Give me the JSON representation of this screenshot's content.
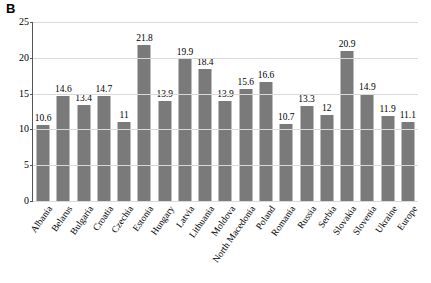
{
  "panel": {
    "label": "B"
  },
  "caption": {
    "text": ""
  },
  "chart_data": {
    "type": "bar",
    "title": "B",
    "xlabel": "",
    "ylabel": "",
    "ylim": [
      0,
      25
    ],
    "yticks": [
      0,
      5,
      10,
      15,
      20,
      25
    ],
    "grid": true,
    "legend": "none",
    "bar_color": "#7a7a7a",
    "categories": [
      "Albania",
      "Belarus",
      "Bulgaria",
      "Croatia",
      "Czechia",
      "Estonia",
      "Hungary",
      "Latvia",
      "Lithuania",
      "Moldova",
      "North Macedonia",
      "Poland",
      "Romania",
      "Russia",
      "Serbia",
      "Slovakia",
      "Slovenia",
      "Ukraine",
      "Europe"
    ],
    "values": [
      10.6,
      14.6,
      13.4,
      14.7,
      11,
      21.8,
      13.9,
      19.9,
      18.4,
      13.9,
      15.6,
      16.6,
      10.7,
      13.3,
      12,
      20.9,
      14.9,
      11.9,
      11.1
    ],
    "value_labels": [
      "10.6",
      "14.6",
      "13.4",
      "14.7",
      "11",
      "21.8",
      "13.9",
      "19.9",
      "18.4",
      "13.9",
      "15.6",
      "16.6",
      "10.7",
      "13.3",
      "12",
      "20.9",
      "14.9",
      "11.9",
      "11.1"
    ]
  }
}
